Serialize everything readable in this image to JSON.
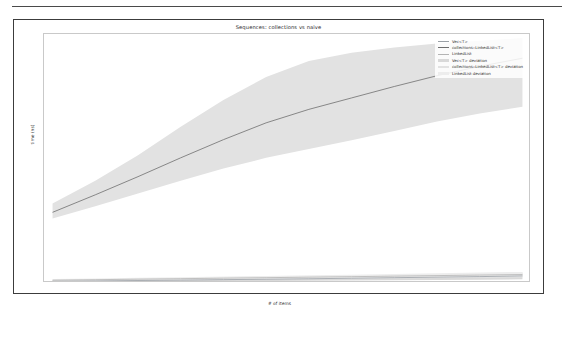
{
  "figure": {
    "title": "Sequences: collections vs naive"
  },
  "chart_data": {
    "type": "line",
    "title": "Sequences: collections vs naive",
    "xlabel": "# of items",
    "ylabel": "time (ns)",
    "xlim": [
      4000,
      15400
    ],
    "ylim": [
      0,
      370000
    ],
    "xticks": [
      "6000",
      "8000",
      "10000",
      "12000",
      "14000"
    ],
    "xtick_values": [
      6000,
      8000,
      10000,
      12000,
      14000
    ],
    "yticks": [
      "0",
      "50000",
      "100000",
      "150000",
      "200000",
      "250000",
      "300000",
      "350000"
    ],
    "ytick_values": [
      0,
      50000,
      100000,
      150000,
      200000,
      250000,
      300000,
      350000
    ],
    "grid": false,
    "legend_position": "upper right",
    "x": [
      4200,
      5200,
      6200,
      7200,
      8200,
      9200,
      10200,
      11200,
      12200,
      13200,
      14200,
      15200
    ],
    "series": [
      {
        "name": "Vec<T>",
        "color": "#9aa0a6",
        "kind": "line",
        "values": [
          2600,
          3100,
          3700,
          4300,
          5000,
          5600,
          6300,
          7100,
          7900,
          8700,
          9500,
          10500
        ]
      },
      {
        "name": "collections::LinkedList<T>",
        "color": "#6e6e6e",
        "kind": "line",
        "values": [
          105000,
          131000,
          158000,
          186000,
          213000,
          238000,
          258000,
          275000,
          292000,
          308000,
          322000,
          334000
        ]
      },
      {
        "name": "LinkedList",
        "color": "#b4b4b4",
        "kind": "line",
        "values": [
          4200,
          4900,
          5700,
          6400,
          7200,
          7900,
          8700,
          9400,
          10200,
          11000,
          11800,
          12600
        ]
      },
      {
        "name": "Vec<T> deviation",
        "color": "#d9d9d9",
        "kind": "band",
        "lower": [
          1200,
          1500,
          1900,
          2200,
          2600,
          2900,
          3300,
          3700,
          4100,
          4500,
          4900,
          5400
        ],
        "upper": [
          4000,
          4700,
          5500,
          6400,
          7400,
          8300,
          9300,
          10500,
          11700,
          12900,
          14100,
          15600
        ]
      },
      {
        "name": "collections::LinkedList<T> deviation",
        "color": "#e2e2e2",
        "kind": "band",
        "lower": [
          96000,
          114000,
          133000,
          152000,
          170000,
          186000,
          199000,
          212000,
          226000,
          240000,
          252000,
          262000
        ],
        "upper": [
          118000,
          152000,
          190000,
          232000,
          272000,
          306000,
          330000,
          342000,
          350000,
          356000,
          360000,
          364000
        ]
      },
      {
        "name": "LinkedList deviation",
        "color": "#ededed",
        "kind": "band",
        "lower": [
          2600,
          3100,
          3700,
          4200,
          4800,
          5300,
          5900,
          6400,
          7000,
          7500,
          8100,
          8700
        ],
        "upper": [
          5800,
          6700,
          7700,
          8600,
          9600,
          10500,
          11500,
          12400,
          13400,
          14500,
          15500,
          16500
        ]
      }
    ]
  },
  "legend": {
    "entries": [
      {
        "label": "Vec<T>"
      },
      {
        "label": "collections::LinkedList<T>"
      },
      {
        "label": "LinkedList"
      },
      {
        "label": "Vec<T> deviation"
      },
      {
        "label": "collections::LinkedList<T> deviation"
      },
      {
        "label": "LinkedList deviation"
      }
    ]
  }
}
